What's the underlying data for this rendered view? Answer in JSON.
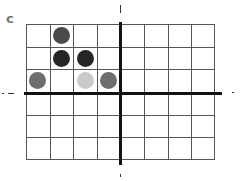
{
  "panel_label": "c",
  "grid": {
    "columns": 8,
    "rows": 6,
    "origin_column_line": 4,
    "origin_row_line": 3
  },
  "pieces": [
    {
      "row": 0,
      "col": 1,
      "shade": "dark-gray",
      "color": "#4a4a4a"
    },
    {
      "row": 1,
      "col": 1,
      "shade": "black",
      "color": "#262626"
    },
    {
      "row": 1,
      "col": 2,
      "shade": "black",
      "color": "#262626"
    },
    {
      "row": 2,
      "col": 0,
      "shade": "medium-gray",
      "color": "#6e6e6e"
    },
    {
      "row": 2,
      "col": 2,
      "shade": "light-gray",
      "color": "#cacaca"
    },
    {
      "row": 2,
      "col": 3,
      "shade": "medium-gray",
      "color": "#6e6e6e"
    }
  ]
}
